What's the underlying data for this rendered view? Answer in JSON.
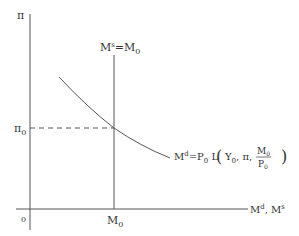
{
  "diagram": {
    "y_axis_label": "π",
    "origin_label": "0",
    "x_axis_label": {
      "main": "M",
      "sup1": "d",
      "sep": ", M",
      "sup2": "s"
    },
    "supply_label": {
      "m": "M",
      "sup": "s",
      "eq": "=M",
      "sub": "0"
    },
    "pi0_label": {
      "main": "π",
      "sub": "0"
    },
    "m0_label": {
      "main": "M",
      "sub": "0"
    },
    "demand_label": {
      "lhs": "M",
      "lhs_sup": "d",
      "eq": "=P",
      "p_sub": "0",
      "func": " L",
      "open_paren": "(",
      "y": "Y",
      "y_sub": "0",
      "args": ", π,",
      "num": "M",
      "num_sub": "0",
      "den": "P",
      "den_sub": "0",
      "close_paren": ")"
    },
    "colors": {
      "line": "#555555",
      "text": "#333333"
    }
  }
}
